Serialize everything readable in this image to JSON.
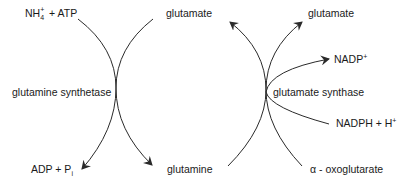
{
  "diagram": {
    "type": "metabolic-pathway",
    "title": "",
    "colors": {
      "line": "#2a2a2a",
      "text": "#1a1a1a",
      "background": "#ffffff"
    },
    "left_reaction": {
      "enzyme": "glutamine synthetase",
      "inputs": {
        "ammonium": {
          "base": "NH",
          "subscript": "4",
          "superscript": "+",
          "suffix": " + ATP"
        },
        "glutamate": "glutamate"
      },
      "outputs": {
        "adp_pi": {
          "base": "ADP + P",
          "subscript": "i"
        },
        "glutamine": "glutamine"
      }
    },
    "right_reaction": {
      "enzyme": "glutamate synthase",
      "inputs": {
        "glutamine": "glutamine",
        "alpha_oxoglutarate": "α - oxoglutarate",
        "nadph": {
          "base": "NADPH + H",
          "superscript": "+"
        }
      },
      "outputs": {
        "glutamate_left": "glutamate",
        "glutamate_right": "glutamate",
        "nadp": {
          "base": "NADP",
          "superscript": "+"
        }
      }
    }
  }
}
